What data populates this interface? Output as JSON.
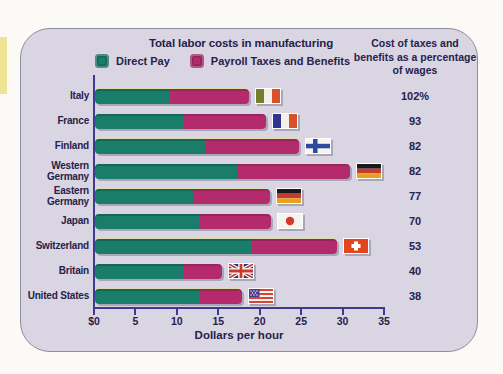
{
  "page": {
    "background_color": "#fbfaf6",
    "left_accent_strip_color": "#efe493"
  },
  "panel": {
    "background_color": "#d9d5e3",
    "border_color": "#8d8d9b"
  },
  "chart_data": {
    "type": "bar",
    "stacked": true,
    "orientation": "horizontal",
    "title": "Total labor costs in manufacturing",
    "xlabel": "Dollars per hour",
    "xlim": [
      0,
      35
    ],
    "xtick_labels": [
      "$0",
      "5",
      "10",
      "15",
      "20",
      "25",
      "30",
      "35"
    ],
    "grid": false,
    "legend_position": "top",
    "categories": [
      "Italy",
      "France",
      "Finland",
      "Western Germany",
      "Eastern Germany",
      "Japan",
      "Switzerland",
      "Britain",
      "United States"
    ],
    "series": [
      {
        "name": "Direct Pay",
        "color": "#1a7d69",
        "values": [
          9.0,
          10.7,
          13.4,
          17.2,
          11.8,
          12.6,
          19.0,
          10.7,
          12.6
        ]
      },
      {
        "name": "Payroll Taxes and Benefits",
        "color": "#b32b6d",
        "values": [
          9.6,
          9.9,
          11.2,
          13.6,
          9.3,
          8.6,
          10.2,
          4.6,
          5.2
        ]
      }
    ],
    "totals": [
      18.6,
      20.6,
      24.6,
      30.8,
      21.1,
      21.2,
      29.2,
      15.3,
      17.8
    ],
    "flag_icons": [
      "italy-flag",
      "france-flag",
      "finland-flag",
      "germany-flag",
      "germany-flag",
      "japan-flag",
      "switzerland-flag",
      "uk-flag",
      "usa-flag"
    ]
  },
  "tax_column": {
    "header_lines": [
      "Cost of taxes and",
      "benefits as a percentage",
      "of wages"
    ],
    "values": [
      "102%",
      "93",
      "82",
      "82",
      "77",
      "70",
      "53",
      "40",
      "38"
    ]
  },
  "axis": {
    "line_color": "#3e3a8f",
    "text_color": "#26224a"
  }
}
